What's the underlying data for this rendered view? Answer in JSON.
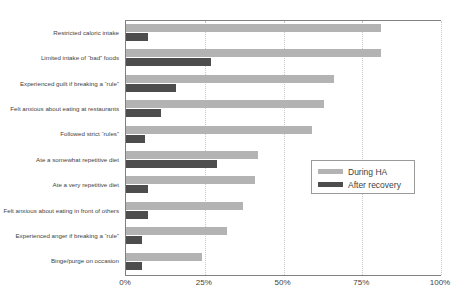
{
  "chart_data": {
    "type": "bar",
    "orientation": "horizontal",
    "title": "",
    "xlabel": "",
    "ylabel": "",
    "xlim": [
      0,
      100
    ],
    "xticks": [
      "0%",
      "25%",
      "50%",
      "75%",
      "100%"
    ],
    "xtick_values": [
      0,
      25,
      50,
      75,
      100
    ],
    "grid": true,
    "legend_position": "middle-right",
    "categories": [
      "Restricted caloric intake",
      "Limited intake of “bad” foods",
      "Experienced guilt if breaking a “rule”",
      "Felt anxious about eating at restaurants",
      "Followed strict “rules”",
      "Ate a somewhat repetitive diet",
      "Ate a very repetitive diet",
      "Felt anxious about eating in front of others",
      "Experienced anger if breaking a “rule”",
      "Binge/purge on occasion"
    ],
    "series": [
      {
        "name": "During HA",
        "color": "#b3b3b3",
        "values": [
          81,
          81,
          66,
          63,
          59,
          42,
          41,
          37,
          32,
          24
        ]
      },
      {
        "name": "After recovery",
        "color": "#4d4d4d",
        "values": [
          7,
          27,
          16,
          11,
          6,
          29,
          7,
          7,
          5,
          5
        ]
      }
    ]
  },
  "legend": {
    "items": [
      {
        "label": "During HA",
        "color": "#b3b3b3"
      },
      {
        "label": "After recovery",
        "color": "#4d4d4d"
      }
    ]
  }
}
